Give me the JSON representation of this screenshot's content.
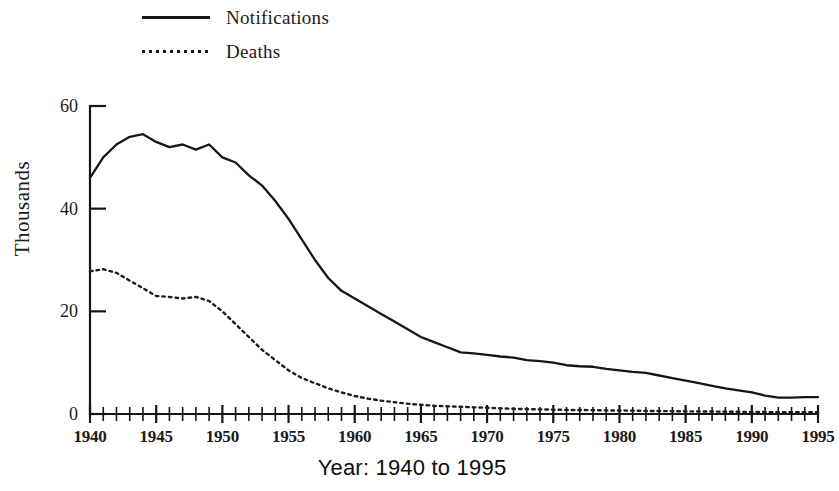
{
  "figure": {
    "background_color": "#ffffff",
    "ink_color": "#161616"
  },
  "legend": {
    "position": "top-left",
    "items": [
      {
        "label": "Notifications",
        "style": "solid",
        "swatch_name": "solid-line-swatch"
      },
      {
        "label": "Deaths",
        "style": "dotted",
        "swatch_name": "dotted-line-swatch"
      }
    ]
  },
  "axes": {
    "y_title": "Thousands",
    "x_title": "Year: 1940 to 1995",
    "y_ticks": [
      "0",
      "20",
      "40",
      "60"
    ],
    "x_ticks": [
      "1940",
      "1945",
      "1950",
      "1955",
      "1960",
      "1965",
      "1970",
      "1975",
      "1980",
      "1985",
      "1990",
      "1995"
    ]
  },
  "chart_data": {
    "type": "line",
    "title": "",
    "subtitle": "",
    "xlabel": "Year: 1940 to 1995",
    "ylabel": "Thousands",
    "xlim": [
      1940,
      1995
    ],
    "ylim": [
      0,
      60
    ],
    "y_ticks": [
      0,
      20,
      40,
      60
    ],
    "x_ticks": [
      1940,
      1945,
      1950,
      1955,
      1960,
      1965,
      1970,
      1975,
      1980,
      1985,
      1990,
      1995
    ],
    "x_minor_tick_interval": 1,
    "grid": false,
    "legend": [
      "Notifications",
      "Deaths"
    ],
    "legend_position": "top-left",
    "units": "thousands",
    "x": [
      1940,
      1941,
      1942,
      1943,
      1944,
      1945,
      1946,
      1947,
      1948,
      1949,
      1950,
      1951,
      1952,
      1953,
      1954,
      1955,
      1956,
      1957,
      1958,
      1959,
      1960,
      1961,
      1962,
      1963,
      1964,
      1965,
      1966,
      1967,
      1968,
      1969,
      1970,
      1971,
      1972,
      1973,
      1974,
      1975,
      1976,
      1977,
      1978,
      1979,
      1980,
      1981,
      1982,
      1983,
      1984,
      1985,
      1986,
      1987,
      1988,
      1989,
      1990,
      1991,
      1992,
      1993,
      1994,
      1995
    ],
    "series": [
      {
        "name": "Notifications",
        "style": "solid",
        "values": [
          46.0,
          50.0,
          52.5,
          54.0,
          54.5,
          53.0,
          52.0,
          52.5,
          51.5,
          52.5,
          50.0,
          49.0,
          46.5,
          44.5,
          41.5,
          38.0,
          34.0,
          30.0,
          26.5,
          24.0,
          22.5,
          21.0,
          19.5,
          18.0,
          16.5,
          15.0,
          14.0,
          13.0,
          12.0,
          11.8,
          11.5,
          11.2,
          11.0,
          10.5,
          10.3,
          10.0,
          9.5,
          9.3,
          9.2,
          8.8,
          8.5,
          8.2,
          8.0,
          7.5,
          7.0,
          6.5,
          6.0,
          5.5,
          5.0,
          4.6,
          4.2,
          3.6,
          3.2,
          3.2,
          3.3,
          3.3
        ]
      },
      {
        "name": "Deaths",
        "style": "dotted",
        "values": [
          27.8,
          28.2,
          27.5,
          26.0,
          24.5,
          23.0,
          22.8,
          22.5,
          22.8,
          22.0,
          20.0,
          17.5,
          15.0,
          12.5,
          10.5,
          8.5,
          7.0,
          6.0,
          5.0,
          4.2,
          3.5,
          3.0,
          2.6,
          2.3,
          2.0,
          1.8,
          1.6,
          1.5,
          1.4,
          1.3,
          1.2,
          1.1,
          1.0,
          0.95,
          0.9,
          0.85,
          0.8,
          0.78,
          0.75,
          0.7,
          0.68,
          0.65,
          0.6,
          0.58,
          0.55,
          0.52,
          0.5,
          0.48,
          0.45,
          0.43,
          0.4,
          0.38,
          0.36,
          0.35,
          0.34,
          0.33
        ]
      }
    ]
  }
}
